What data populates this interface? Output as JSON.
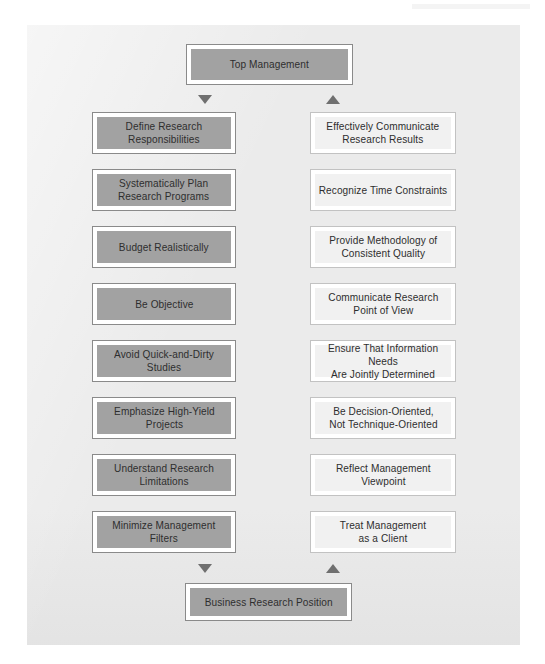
{
  "diagram": {
    "title": "Top Management",
    "bottom_title": "Business Research Position",
    "colors": {
      "page_background": "#ffffff",
      "panel_background": "#ebebeb",
      "filled_box_fill": "#a2a2a2",
      "filled_box_border": "#8a8a8a",
      "light_box_fill": "#f1f1f1",
      "light_box_border": "#c2c2c2",
      "text": "#2e2e2e",
      "arrow": "#6f6f6f"
    },
    "top_node": {
      "label": "Top Management",
      "style": "filled"
    },
    "bottom_node": {
      "label": "Business Research Position",
      "style": "filled"
    },
    "arrows": {
      "top_down": "down-arrow",
      "top_up": "up-arrow",
      "bottom_down": "down-arrow",
      "bottom_up": "up-arrow"
    },
    "left_column": {
      "style": "filled",
      "items": [
        {
          "label": "Define Research\nResponsibilities"
        },
        {
          "label": "Systematically Plan\nResearch Programs"
        },
        {
          "label": "Budget Realistically"
        },
        {
          "label": "Be Objective"
        },
        {
          "label": "Avoid Quick-and-Dirty\nStudies"
        },
        {
          "label": "Emphasize High-Yield\nProjects"
        },
        {
          "label": "Understand Research\nLimitations"
        },
        {
          "label": "Minimize Management\nFilters"
        }
      ]
    },
    "right_column": {
      "style": "light",
      "items": [
        {
          "label": "Effectively Communicate\nResearch Results"
        },
        {
          "label": "Recognize Time Constraints"
        },
        {
          "label": "Provide Methodology of\nConsistent Quality"
        },
        {
          "label": "Communicate Research\nPoint of View"
        },
        {
          "label": "Ensure That Information Needs\nAre Jointly Determined"
        },
        {
          "label": "Be Decision-Oriented,\nNot Technique-Oriented"
        },
        {
          "label": "Reflect Management\nViewpoint"
        },
        {
          "label": "Treat Management\nas a Client"
        }
      ]
    }
  }
}
